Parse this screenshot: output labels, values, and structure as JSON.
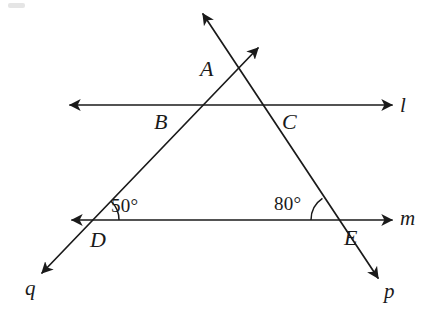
{
  "figure": {
    "kind": "geometry-diagram",
    "background_color": "#ffffff",
    "stroke_color": "#1a1a1a"
  },
  "lines": [
    {
      "id": "l",
      "label": "l",
      "label_x": 400,
      "label_y": 95,
      "x1": 70,
      "y1": 105,
      "x2": 392,
      "y2": 105,
      "arrow_start": true,
      "arrow_end": true
    },
    {
      "id": "m",
      "label": "m",
      "label_x": 400,
      "label_y": 208,
      "x1": 72,
      "y1": 220,
      "x2": 392,
      "y2": 220,
      "arrow_start": true,
      "arrow_end": true
    },
    {
      "id": "q",
      "label": "q",
      "label_x": 25,
      "label_y": 278,
      "x1": 42,
      "y1": 273,
      "x2": 258,
      "y2": 48,
      "arrow_start": true,
      "arrow_end": true
    },
    {
      "id": "p",
      "label": "p",
      "label_x": 384,
      "label_y": 281,
      "x1": 203,
      "y1": 14,
      "x2": 378,
      "y2": 278,
      "arrow_start": true,
      "arrow_end": true
    }
  ],
  "points": [
    {
      "id": "A",
      "label": "A",
      "x": 235,
      "y": 68,
      "label_x": 200,
      "label_y": 58
    },
    {
      "id": "B",
      "label": "B",
      "x": 200,
      "y": 105,
      "label_x": 154,
      "label_y": 111
    },
    {
      "id": "C",
      "label": "C",
      "x": 258,
      "y": 105,
      "label_x": 282,
      "label_y": 111
    },
    {
      "id": "D",
      "label": "D",
      "x": 93,
      "y": 220,
      "label_x": 90,
      "label_y": 229
    },
    {
      "id": "E",
      "label": "E",
      "x": 337,
      "y": 220,
      "label_x": 344,
      "label_y": 227
    }
  ],
  "angles": [
    {
      "id": "angle-at-D",
      "vertex": "D",
      "value": "50°",
      "degrees": 50,
      "label_x": 111,
      "label_y": 196,
      "arc_vertex_x": 93,
      "arc_vertex_y": 220,
      "arc_radius": 26,
      "arc_start_deg": 0,
      "arc_end_deg": -46
    },
    {
      "id": "angle-at-E",
      "vertex": "E",
      "value": "80°",
      "degrees": 80,
      "label_x": 274,
      "label_y": 194,
      "arc_vertex_x": 337,
      "arc_vertex_y": 220,
      "arc_radius": 26,
      "arc_start_deg": 180,
      "arc_end_deg": 236
    }
  ]
}
